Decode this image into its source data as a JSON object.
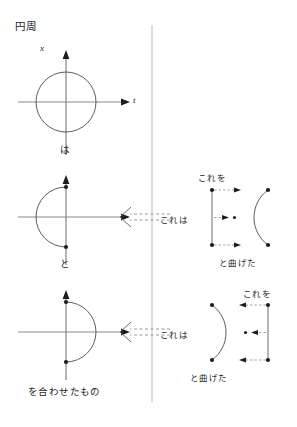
{
  "page": {
    "title": "円周",
    "background_color": "#ffffff",
    "ink_color": "#1d1d1d",
    "line_color": "#555555",
    "divider_color": "#b9b9b9",
    "width": 297,
    "height": 427
  },
  "divider": {
    "name": "vertical-divider",
    "x": 152,
    "y_top": 25,
    "y_bottom": 402
  },
  "left_column": {
    "figures": [
      {
        "id": "circle-figure",
        "type": "full-circle",
        "axis_label_vertical": "x",
        "axis_label_horizontal": "t",
        "caption_below": "は",
        "center": [
          66,
          102
        ],
        "radius": 30
      },
      {
        "id": "left-semicircle-figure",
        "type": "semicircle-open-right",
        "caption_below": "と",
        "center": [
          66,
          217
        ],
        "radius": 30
      },
      {
        "id": "right-semicircle-figure",
        "type": "semicircle-open-left",
        "caption_below": "を合わせたもの",
        "center": [
          66,
          332
        ],
        "radius": 30
      }
    ]
  },
  "arrows": [
    {
      "id": "upper-transform-arrow",
      "style": "dashed-left-arrow",
      "label": "これは",
      "y": 217
    },
    {
      "id": "lower-transform-arrow",
      "style": "dashed-left-arrow",
      "label": "これは",
      "y": 332
    }
  ],
  "right_column": {
    "figures": [
      {
        "id": "bend-figure-upper",
        "type": "segment-bent-into-c-open-right",
        "label_top": "これを",
        "label_bottom": "と曲げた",
        "segment_x": 212,
        "segment_y_top": 190,
        "segment_y_bottom": 245
      },
      {
        "id": "bend-figure-lower",
        "type": "segment-bent-into-c-open-left",
        "label_top": "これを",
        "label_bottom": "と曲げた",
        "segment_x": 262,
        "segment_y_top": 305,
        "segment_y_bottom": 360
      }
    ]
  }
}
